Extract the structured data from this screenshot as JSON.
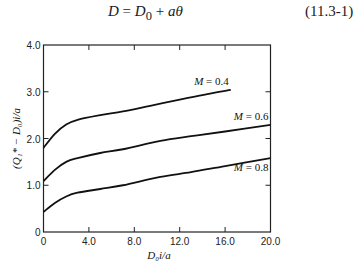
{
  "equation": {
    "lhs": "D",
    "equals": " = ",
    "d0_base": "D",
    "d0_sub": "0",
    "plus": " + ",
    "rhs_term": "aθ",
    "number": "(11.3-1)"
  },
  "chart_data": {
    "type": "line",
    "title": "",
    "xlabel": "D₀i/a",
    "ylabel": "(Q₁* − D₀)i/a",
    "xlim": [
      0,
      20
    ],
    "ylim": [
      0,
      4.0
    ],
    "grid": false,
    "x_ticks": [
      "0",
      "4.0",
      "8.0",
      "12.0",
      "16.0",
      "20.0"
    ],
    "y_ticks": [
      "0",
      "1.0",
      "2.0",
      "3.0",
      "4.0"
    ],
    "legend": "inline labels at curve ends",
    "series": [
      {
        "name": "M = 0.4",
        "x": [
          0,
          1.0,
          2.0,
          3.0,
          5.0,
          7.0,
          9.4,
          12.0,
          14.0,
          16.5
        ],
        "y": [
          1.8,
          2.1,
          2.3,
          2.4,
          2.5,
          2.58,
          2.7,
          2.83,
          2.93,
          3.04
        ]
      },
      {
        "name": "M = 0.6",
        "x": [
          0,
          1.0,
          2.0,
          3.0,
          5.0,
          7.0,
          10.3,
          13.0,
          16.0,
          20.0
        ],
        "y": [
          1.09,
          1.33,
          1.5,
          1.58,
          1.69,
          1.77,
          1.95,
          2.05,
          2.15,
          2.29
        ]
      },
      {
        "name": "M = 0.8",
        "x": [
          0,
          1.0,
          2.0,
          3.0,
          5.0,
          7.0,
          10.3,
          13.0,
          16.0,
          20.0
        ],
        "y": [
          0.43,
          0.62,
          0.76,
          0.84,
          0.92,
          1.0,
          1.18,
          1.28,
          1.41,
          1.58
        ]
      }
    ]
  }
}
